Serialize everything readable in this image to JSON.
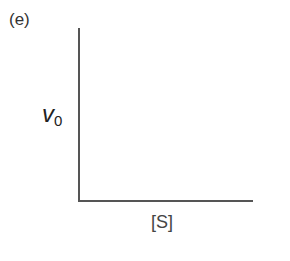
{
  "panel": {
    "label": "(e)"
  },
  "chart_data": {
    "type": "line",
    "title": "",
    "panel_label": "(e)",
    "xlabel": "[S]",
    "ylabel": "v0",
    "ylabel_main": "v",
    "ylabel_sub": "0",
    "series": [],
    "grid": false,
    "legend": null
  }
}
